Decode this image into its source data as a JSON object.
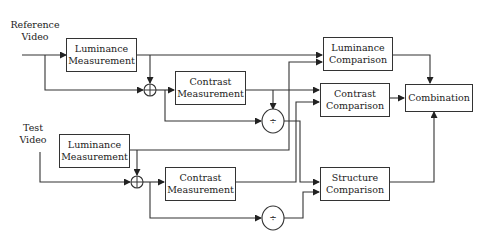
{
  "diagram": {
    "inputs": {
      "reference": "Reference\nVideo",
      "reference_line1": "Reference",
      "reference_line2": "Video",
      "test_line1": "Test",
      "test_line2": "Video"
    },
    "blocks": {
      "ref_luminance_measurement": {
        "line1": "Luminance",
        "line2": "Measurement"
      },
      "ref_contrast_measurement": {
        "line1": "Contrast",
        "line2": "Measurement"
      },
      "test_luminance_measurement": {
        "line1": "Luminance",
        "line2": "Measurement"
      },
      "test_contrast_measurement": {
        "line1": "Contrast",
        "line2": "Measurement"
      },
      "luminance_comparison": {
        "line1": "Luminance",
        "line2": "Comparison"
      },
      "contrast_comparison": {
        "line1": "Contrast",
        "line2": "Comparison"
      },
      "structure_comparison": {
        "line1": "Structure",
        "line2": "Comparison"
      },
      "combination": {
        "line1": "Combination"
      }
    },
    "operators": {
      "ref_sum": "⊕",
      "test_sum": "⊕",
      "ref_divide": "÷",
      "test_divide": "÷"
    },
    "colors": {
      "stroke": "#333333",
      "background": "#ffffff"
    }
  }
}
